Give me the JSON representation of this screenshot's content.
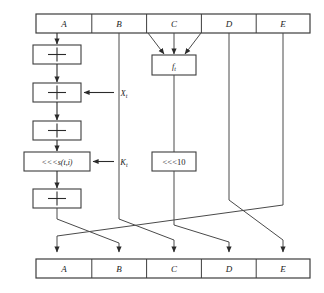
{
  "figure": {
    "name": "ripemd-160-round-function",
    "top_registers": [
      {
        "id": "A",
        "label": "A"
      },
      {
        "id": "B",
        "label": "B"
      },
      {
        "id": "C",
        "label": "C"
      },
      {
        "id": "D",
        "label": "D"
      },
      {
        "id": "E",
        "label": "E"
      }
    ],
    "bottom_registers": [
      {
        "id": "A",
        "label": "A"
      },
      {
        "id": "B",
        "label": "B"
      },
      {
        "id": "C",
        "label": "C"
      },
      {
        "id": "D",
        "label": "D"
      },
      {
        "id": "E",
        "label": "E"
      }
    ],
    "operations": {
      "add1": "+",
      "add2": "+",
      "add3": "+",
      "add4": "+",
      "nonlinear_function": "f",
      "nonlinear_function_subscript": "t",
      "rotate_variable": "<<<s(t,i)",
      "rotate_fixed": "<<<10"
    },
    "inputs": [
      {
        "name": "message-word",
        "label": "X",
        "subscript": "t"
      },
      {
        "name": "round-constant",
        "label": "K",
        "subscript": "t"
      }
    ],
    "colors": {
      "background": "#ffffff",
      "stroke": "#3d3d3d",
      "wire": "#4a4a4a",
      "text": "#1c1c1c"
    }
  }
}
